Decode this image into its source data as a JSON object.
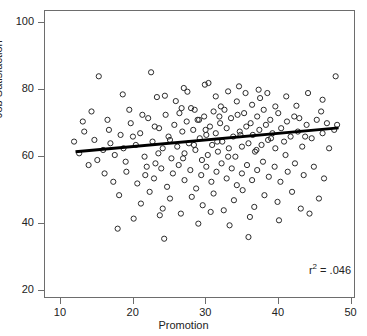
{
  "chart_data": {
    "type": "scatter",
    "title": "",
    "xlabel": "Promotion",
    "ylabel": "Job Satisfaction",
    "xlim": [
      7.8,
      50.6
    ],
    "ylim": [
      17.5,
      103.5
    ],
    "xticks": [
      10,
      20,
      30,
      40,
      50
    ],
    "yticks": [
      20,
      40,
      60,
      80,
      100
    ],
    "grid": false,
    "legend": null,
    "marker": "open-circle",
    "annotations": [
      {
        "text": "r2 = .046",
        "r_squared": 0.046,
        "position": "bottom-right"
      }
    ],
    "trendline": {
      "type": "linear",
      "x_start": 12.0,
      "y_start": 61.5,
      "x_end": 48.2,
      "y_end": 68.6,
      "slope": 0.196,
      "intercept": 59.15,
      "color": "#000000",
      "width": 3
    },
    "points": [
      [
        15.2,
        84.0
      ],
      [
        18.5,
        78.6
      ],
      [
        22.4,
        85.2
      ],
      [
        23.2,
        77.8
      ],
      [
        24.3,
        78.2
      ],
      [
        25.8,
        76.6
      ],
      [
        26.6,
        74.5
      ],
      [
        27.4,
        79.4
      ],
      [
        28.4,
        74.0
      ],
      [
        29.0,
        71.0
      ],
      [
        30.3,
        82.0
      ],
      [
        31.3,
        78.0
      ],
      [
        32.0,
        75.0
      ],
      [
        33.0,
        79.5
      ],
      [
        34.2,
        76.5
      ],
      [
        35.4,
        79.0
      ],
      [
        36.3,
        75.5
      ],
      [
        37.4,
        77.5
      ],
      [
        38.4,
        79.0
      ],
      [
        39.5,
        75.0
      ],
      [
        41.0,
        78.0
      ],
      [
        42.4,
        75.2
      ],
      [
        44.0,
        79.0
      ],
      [
        46.0,
        77.0
      ],
      [
        47.8,
        84.0
      ],
      [
        13.0,
        70.5
      ],
      [
        14.6,
        65.0
      ],
      [
        15.8,
        62.0
      ],
      [
        16.6,
        68.0
      ],
      [
        17.4,
        60.5
      ],
      [
        18.2,
        66.5
      ],
      [
        18.9,
        58.5
      ],
      [
        19.6,
        70.0
      ],
      [
        20.3,
        63.5
      ],
      [
        20.9,
        67.0
      ],
      [
        21.5,
        60.0
      ],
      [
        22.0,
        71.5
      ],
      [
        22.6,
        64.5
      ],
      [
        23.0,
        58.0
      ],
      [
        23.5,
        68.5
      ],
      [
        24.0,
        62.5
      ],
      [
        24.4,
        72.5
      ],
      [
        24.8,
        66.0
      ],
      [
        25.2,
        59.5
      ],
      [
        25.6,
        69.5
      ],
      [
        26.0,
        63.0
      ],
      [
        26.3,
        73.0
      ],
      [
        26.7,
        67.5
      ],
      [
        27.0,
        61.0
      ],
      [
        27.3,
        70.5
      ],
      [
        27.6,
        64.0
      ],
      [
        27.9,
        74.5
      ],
      [
        28.2,
        68.0
      ],
      [
        28.5,
        62.0
      ],
      [
        28.8,
        71.0
      ],
      [
        29.1,
        65.5
      ],
      [
        29.4,
        59.0
      ],
      [
        29.7,
        72.0
      ],
      [
        30.0,
        66.5
      ],
      [
        30.2,
        60.5
      ],
      [
        30.5,
        69.0
      ],
      [
        30.8,
        63.5
      ],
      [
        31.0,
        73.5
      ],
      [
        31.3,
        67.0
      ],
      [
        31.6,
        61.5
      ],
      [
        31.9,
        70.0
      ],
      [
        32.2,
        64.5
      ],
      [
        32.5,
        74.0
      ],
      [
        32.8,
        68.5
      ],
      [
        33.1,
        62.5
      ],
      [
        33.4,
        71.5
      ],
      [
        33.7,
        66.0
      ],
      [
        34.0,
        60.0
      ],
      [
        34.3,
        72.5
      ],
      [
        34.6,
        67.5
      ],
      [
        34.9,
        63.0
      ],
      [
        35.2,
        73.0
      ],
      [
        35.5,
        69.0
      ],
      [
        35.8,
        64.0
      ],
      [
        36.1,
        70.0
      ],
      [
        36.4,
        66.5
      ],
      [
        36.7,
        61.5
      ],
      [
        37.0,
        72.0
      ],
      [
        37.3,
        68.0
      ],
      [
        37.6,
        63.5
      ],
      [
        37.9,
        74.0
      ],
      [
        38.2,
        69.5
      ],
      [
        38.5,
        65.0
      ],
      [
        38.8,
        71.0
      ],
      [
        39.1,
        67.0
      ],
      [
        39.5,
        62.5
      ],
      [
        39.9,
        73.0
      ],
      [
        40.3,
        68.5
      ],
      [
        40.7,
        64.5
      ],
      [
        41.1,
        70.5
      ],
      [
        41.6,
        66.0
      ],
      [
        42.1,
        72.0
      ],
      [
        42.6,
        67.5
      ],
      [
        43.2,
        63.0
      ],
      [
        43.8,
        69.5
      ],
      [
        44.5,
        65.5
      ],
      [
        45.2,
        71.0
      ],
      [
        46.0,
        67.0
      ],
      [
        46.9,
        62.5
      ],
      [
        47.6,
        68.0
      ],
      [
        19.0,
        55.5
      ],
      [
        20.5,
        52.0
      ],
      [
        21.8,
        57.0
      ],
      [
        22.8,
        53.5
      ],
      [
        23.8,
        56.5
      ],
      [
        24.6,
        51.0
      ],
      [
        25.4,
        55.0
      ],
      [
        26.2,
        57.5
      ],
      [
        27.0,
        53.0
      ],
      [
        27.8,
        56.0
      ],
      [
        28.6,
        50.5
      ],
      [
        29.3,
        54.5
      ],
      [
        30.0,
        57.0
      ],
      [
        30.7,
        52.5
      ],
      [
        31.4,
        55.5
      ],
      [
        32.1,
        58.0
      ],
      [
        32.8,
        53.5
      ],
      [
        33.5,
        56.5
      ],
      [
        34.2,
        51.5
      ],
      [
        34.9,
        55.0
      ],
      [
        35.6,
        57.5
      ],
      [
        36.3,
        53.0
      ],
      [
        37.0,
        56.0
      ],
      [
        37.8,
        58.5
      ],
      [
        38.6,
        54.0
      ],
      [
        39.4,
        57.0
      ],
      [
        40.2,
        52.5
      ],
      [
        41.2,
        55.5
      ],
      [
        42.2,
        58.0
      ],
      [
        43.4,
        54.5
      ],
      [
        44.8,
        57.0
      ],
      [
        46.2,
        53.5
      ],
      [
        12.5,
        61.0
      ],
      [
        13.8,
        57.5
      ],
      [
        16.0,
        55.0
      ],
      [
        17.2,
        52.5
      ],
      [
        18.0,
        48.5
      ],
      [
        21.0,
        46.0
      ],
      [
        22.2,
        49.5
      ],
      [
        24.0,
        44.5
      ],
      [
        25.0,
        47.5
      ],
      [
        26.5,
        43.0
      ],
      [
        28.0,
        48.0
      ],
      [
        29.5,
        45.5
      ],
      [
        31.0,
        49.0
      ],
      [
        32.4,
        44.0
      ],
      [
        33.8,
        47.0
      ],
      [
        35.0,
        50.0
      ],
      [
        36.6,
        45.0
      ],
      [
        38.0,
        48.5
      ],
      [
        39.8,
        46.5
      ],
      [
        41.8,
        49.5
      ],
      [
        43.0,
        44.5
      ],
      [
        45.5,
        47.5
      ],
      [
        17.8,
        38.5
      ],
      [
        20.0,
        41.5
      ],
      [
        23.6,
        42.5
      ],
      [
        28.9,
        40.0
      ],
      [
        30.6,
        43.5
      ],
      [
        33.2,
        39.5
      ],
      [
        36.0,
        42.0
      ],
      [
        40.0,
        41.0
      ],
      [
        44.2,
        43.0
      ],
      [
        14.2,
        73.5
      ],
      [
        16.4,
        71.0
      ],
      [
        19.4,
        74.0
      ],
      [
        21.2,
        72.5
      ],
      [
        22.9,
        69.0
      ],
      [
        26.9,
        80.5
      ],
      [
        29.8,
        81.5
      ],
      [
        31.8,
        72.0
      ],
      [
        34.5,
        81.0
      ],
      [
        37.2,
        80.0
      ],
      [
        42.8,
        71.5
      ],
      [
        45.8,
        73.5
      ],
      [
        48.0,
        69.5
      ],
      [
        11.8,
        64.5
      ],
      [
        13.2,
        67.5
      ],
      [
        15.0,
        59.0
      ],
      [
        16.8,
        64.0
      ],
      [
        18.6,
        62.5
      ],
      [
        19.9,
        66.0
      ],
      [
        21.6,
        54.5
      ],
      [
        23.4,
        61.0
      ],
      [
        25.0,
        65.0
      ],
      [
        26.8,
        59.5
      ],
      [
        28.3,
        63.5
      ],
      [
        29.9,
        68.0
      ],
      [
        31.5,
        64.5
      ],
      [
        33.0,
        60.0
      ],
      [
        34.7,
        66.5
      ],
      [
        36.9,
        62.0
      ],
      [
        38.9,
        65.5
      ],
      [
        40.9,
        60.5
      ],
      [
        43.6,
        66.0
      ],
      [
        46.6,
        70.0
      ],
      [
        24.2,
        35.5
      ],
      [
        35.8,
        36.0
      ]
    ]
  },
  "axes": {
    "x_tick_labels": [
      "10",
      "20",
      "30",
      "40",
      "50"
    ],
    "y_tick_labels": [
      "20",
      "40",
      "60",
      "80",
      "100"
    ],
    "x_title": "Promotion",
    "y_title": "Job Satisfaction"
  },
  "annotation_text": {
    "r2_prefix": "r",
    "r2_exponent": "2",
    "r2_value": "= .046"
  }
}
